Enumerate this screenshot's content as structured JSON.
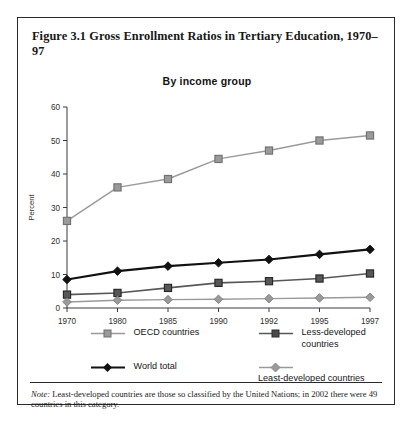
{
  "figure": {
    "title": "Figure 3.1 Gross Enrollment Ratios in Tertiary Education, 1970–97",
    "subtitle": "By income group",
    "note_label": "Note:",
    "note_text": "Least-developed countries are those so classified by the United Nations; in 2002 there were 49 countries in this category."
  },
  "chart_data": {
    "type": "line",
    "title": "By income group",
    "xlabel": "Year",
    "ylabel": "Percent",
    "categories": [
      "1970",
      "1980",
      "1985",
      "1990",
      "1992",
      "1995",
      "1997"
    ],
    "x": [
      1970,
      1980,
      1985,
      1990,
      1992,
      1995,
      1997
    ],
    "ylim": [
      0,
      60
    ],
    "yticks": [
      0,
      10,
      20,
      30,
      40,
      50,
      60
    ],
    "grid": false,
    "legend_position": "bottom",
    "series": [
      {
        "name": "OECD countries",
        "marker": "square",
        "color": "#9a9a9a",
        "values": [
          26,
          36,
          38.5,
          44.5,
          47,
          50,
          51.5
        ]
      },
      {
        "name": "Less-developed countries",
        "marker": "square",
        "color": "#575757",
        "values": [
          4,
          4.5,
          6,
          7.5,
          8,
          8.8,
          10.3
        ]
      },
      {
        "name": "World total",
        "marker": "diamond",
        "color": "#111111",
        "values": [
          8.5,
          11,
          12.5,
          13.5,
          14.5,
          16,
          17.5
        ]
      },
      {
        "name": "Least-developed countries",
        "marker": "diamond",
        "color": "#9a9a9a",
        "values": [
          1.8,
          2.3,
          2.5,
          2.6,
          2.8,
          3.0,
          3.2
        ]
      }
    ]
  },
  "legend": [
    {
      "label": "OECD countries"
    },
    {
      "label": "Less-developed countries"
    },
    {
      "label": "World total"
    },
    {
      "label": "Least-developed countries"
    }
  ],
  "colors": {
    "oecd": "#9a9a9a",
    "less_developed": "#575757",
    "world_total": "#111111",
    "least_developed": "#9a9a9a",
    "frame": "#2a2a2a"
  }
}
